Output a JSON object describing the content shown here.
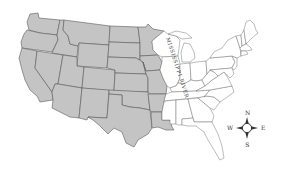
{
  "map": {
    "title": "",
    "region": "Contiguous United States",
    "highlight": {
      "description": "States west of the Mississippi River shaded gray",
      "west_fill": "#c4c4c4",
      "east_fill": "#ffffff",
      "border_color": "#5a5a5a"
    },
    "labels": {
      "river": "MISSISSIPPI RIVER"
    },
    "compass": {
      "north": "N",
      "east": "E",
      "south": "S",
      "west": "W"
    }
  }
}
